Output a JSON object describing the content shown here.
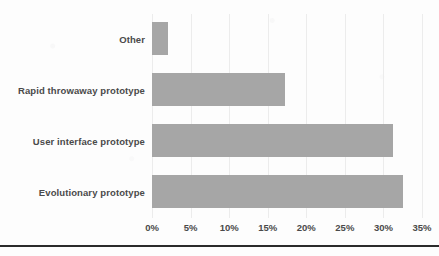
{
  "chart_data": {
    "type": "bar",
    "orientation": "horizontal",
    "title": "",
    "xlabel": "",
    "ylabel": "",
    "categories": [
      "Other",
      "Rapid throwaway prototype",
      "User interface prototype",
      "Evolutionary prototype"
    ],
    "values": [
      2.1,
      17.3,
      31.3,
      32.6
    ],
    "value_unit": "%",
    "xlim": [
      0,
      35
    ],
    "xticks": [
      0,
      5,
      10,
      15,
      20,
      25,
      30,
      35
    ],
    "xtick_labels": [
      "0%",
      "5%",
      "10%",
      "15%",
      "20%",
      "25%",
      "30%",
      "35%"
    ],
    "grid": "vertical",
    "legend": null,
    "bar_color": "#a6a6a6",
    "label_color": "#4a4a4a",
    "gridline_color": "#ececec",
    "background_color": "#fdfdfd",
    "rule_color": "#2b2b2b"
  }
}
